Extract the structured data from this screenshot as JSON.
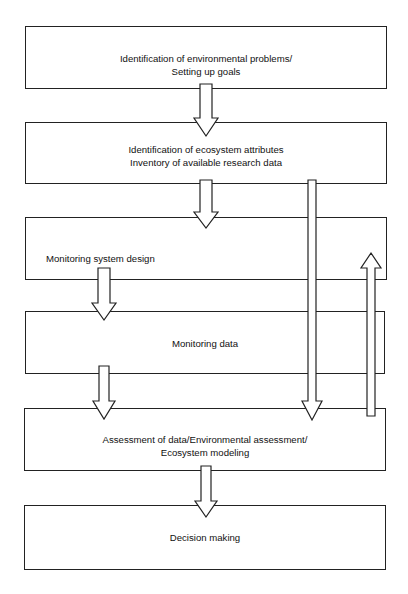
{
  "diagram": {
    "type": "flowchart",
    "boxes": [
      {
        "id": "b1",
        "line1": "Identification of environmental problems/",
        "line2": "Setting up goals"
      },
      {
        "id": "b2",
        "line1": "Identification of ecosystem attributes",
        "line2": "Inventory of available research data"
      },
      {
        "id": "b3",
        "line1": "Monitoring system design"
      },
      {
        "id": "b4",
        "line1": "Monitoring data"
      },
      {
        "id": "b5",
        "line1": "Assessment of data/Environmental assessment/",
        "line2": "Ecosystem modeling"
      },
      {
        "id": "b6",
        "line1": "Decision making"
      }
    ],
    "arrows": [
      {
        "from": "b1",
        "to": "b2",
        "direction": "down"
      },
      {
        "from": "b2",
        "to": "b3",
        "direction": "down"
      },
      {
        "from": "b3",
        "to": "b4",
        "direction": "down"
      },
      {
        "from": "b4",
        "to": "b5",
        "direction": "down"
      },
      {
        "from": "b2",
        "to": "b5",
        "direction": "down",
        "note": "bypass arrow"
      },
      {
        "from": "b5",
        "to": "b3",
        "direction": "up",
        "note": "feedback arrow"
      },
      {
        "from": "b5",
        "to": "b6",
        "direction": "down"
      }
    ]
  }
}
